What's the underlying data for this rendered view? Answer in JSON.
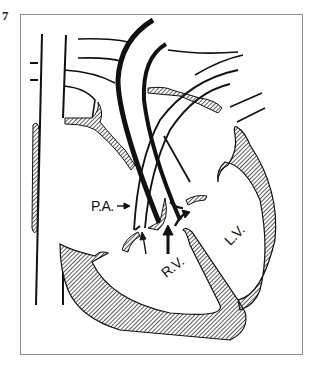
{
  "figure": {
    "number": "7",
    "type": "anatomical heart diagram (catheter course)",
    "labels": {
      "pulmonary_artery": "P.A.",
      "right_ventricle": "R.V.",
      "left_ventricle": "L.V."
    },
    "colors": {
      "ink": "#111111",
      "frame": "#8a8a8a",
      "hatch": "#555555",
      "background": "#ffffff"
    }
  }
}
